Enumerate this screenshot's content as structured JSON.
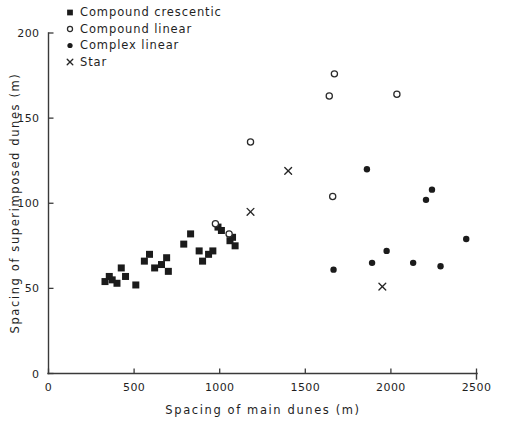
{
  "figure": {
    "background_color": "#ffffff",
    "ink_color": "#1b1b1b"
  },
  "chart_data": {
    "type": "scatter",
    "title": "",
    "xlabel": "Spacing of main dunes (m)",
    "ylabel": "Spacing of superimposed dunes (m)",
    "xlim": [
      0,
      2500
    ],
    "ylim": [
      0,
      200
    ],
    "xticks": [
      0,
      500,
      1000,
      1500,
      2000,
      2500
    ],
    "yticks": [
      0,
      50,
      100,
      150,
      200
    ],
    "xtick_labels": [
      "0",
      "500",
      "1000",
      "1500",
      "2000",
      "2500"
    ],
    "ytick_labels": [
      "0",
      "50",
      "100",
      "150",
      "200"
    ],
    "grid": false,
    "legend_position": "top-left",
    "series": [
      {
        "name": "Compound crescentic",
        "marker": "filled-square",
        "color": "#1b1b1b",
        "points": [
          [
            330,
            54
          ],
          [
            355,
            57
          ],
          [
            372,
            55
          ],
          [
            400,
            53
          ],
          [
            425,
            62
          ],
          [
            450,
            57
          ],
          [
            510,
            52
          ],
          [
            560,
            66
          ],
          [
            590,
            70
          ],
          [
            620,
            62
          ],
          [
            660,
            64
          ],
          [
            690,
            68
          ],
          [
            700,
            60
          ],
          [
            790,
            76
          ],
          [
            830,
            82
          ],
          [
            880,
            72
          ],
          [
            900,
            66
          ],
          [
            935,
            70
          ],
          [
            960,
            72
          ],
          [
            990,
            86
          ],
          [
            1010,
            84
          ],
          [
            1060,
            78
          ],
          [
            1075,
            80
          ],
          [
            1090,
            75
          ]
        ]
      },
      {
        "name": "Compound linear",
        "marker": "open-circle",
        "color": "#2a2a2a",
        "points": [
          [
            975,
            88
          ],
          [
            1055,
            82
          ],
          [
            1180,
            136
          ],
          [
            1640,
            163
          ],
          [
            1670,
            176
          ],
          [
            1660,
            104
          ],
          [
            2035,
            164
          ]
        ]
      },
      {
        "name": "Complex linear",
        "marker": "filled-circle",
        "color": "#1b1b1b",
        "points": [
          [
            1665,
            61
          ],
          [
            1860,
            120
          ],
          [
            1890,
            65
          ],
          [
            1975,
            72
          ],
          [
            2130,
            65
          ],
          [
            2205,
            102
          ],
          [
            2240,
            108
          ],
          [
            2290,
            63
          ],
          [
            2440,
            79
          ]
        ]
      },
      {
        "name": "Star",
        "marker": "cross",
        "color": "#262626",
        "points": [
          [
            1180,
            95
          ],
          [
            1400,
            119
          ],
          [
            1950,
            51
          ]
        ]
      }
    ]
  },
  "legend": {
    "entries": [
      {
        "label": "Compound  crescentic",
        "marker": "filled-square"
      },
      {
        "label": "Compound  linear",
        "marker": "open-circle"
      },
      {
        "label": "Complex  linear",
        "marker": "filled-circle"
      },
      {
        "label": "Star",
        "marker": "cross"
      }
    ]
  }
}
